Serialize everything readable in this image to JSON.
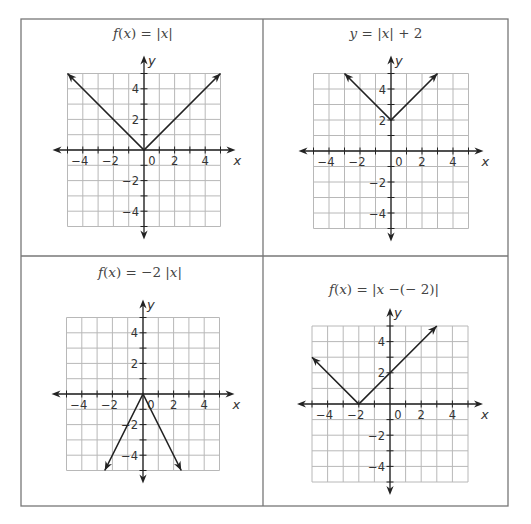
{
  "figure": {
    "frame": {
      "left": 21,
      "top": 19,
      "right": 508,
      "bottom": 506,
      "mid_x": 263,
      "mid_y": 256,
      "stroke": "#777777"
    },
    "colors": {
      "grid": "#b8b8b8",
      "axis": "#222222",
      "curve": "#222222",
      "text": "#444444"
    }
  },
  "chart_data": [
    {
      "type": "line",
      "title": "f(x) = |x|",
      "title_parts": [
        {
          "t": "f",
          "i": true
        },
        {
          "t": "(",
          "i": false
        },
        {
          "t": "x",
          "i": true
        },
        {
          "t": ") = |",
          "i": false
        },
        {
          "t": "x",
          "i": true
        },
        {
          "t": "|",
          "i": false
        }
      ],
      "xlabel": "x",
      "ylabel": "y",
      "xlim": [
        -5,
        5
      ],
      "ylim": [
        -5,
        5
      ],
      "grid": true,
      "x_tick_labels": [
        "-4",
        "-2",
        "0",
        "2",
        "4"
      ],
      "y_tick_labels": [
        "4",
        "2",
        "-2",
        "-4"
      ],
      "series": [
        {
          "name": "f(x) = |x|",
          "points": [
            [
              -5,
              5
            ],
            [
              0,
              0
            ],
            [
              5,
              5
            ]
          ],
          "arrows": "both"
        }
      ],
      "layout": {
        "ox": 144,
        "oy": 150,
        "unit": 15.3,
        "title_x": 143,
        "title_y": 38
      }
    },
    {
      "type": "line",
      "title": "y = |x| + 2",
      "title_parts": [
        {
          "t": "y",
          "i": true
        },
        {
          "t": " = |",
          "i": false
        },
        {
          "t": "x",
          "i": true
        },
        {
          "t": "| + 2",
          "i": false
        }
      ],
      "xlabel": "x",
      "ylabel": "y",
      "xlim": [
        -5,
        5
      ],
      "ylim": [
        -5,
        5
      ],
      "grid": true,
      "x_tick_labels": [
        "-4",
        "-2",
        "0",
        "2",
        "4"
      ],
      "y_tick_labels": [
        "4",
        "2",
        "-2",
        "-4"
      ],
      "series": [
        {
          "name": "y = |x| + 2",
          "points": [
            [
              -3,
              5
            ],
            [
              0,
              2
            ],
            [
              3,
              5
            ]
          ],
          "arrows": "both"
        }
      ],
      "layout": {
        "ox": 391,
        "oy": 151,
        "unit": 15.5,
        "title_x": 386,
        "title_y": 38
      }
    },
    {
      "type": "line",
      "title": "f(x) = -2|x|",
      "title_parts": [
        {
          "t": "f",
          "i": true
        },
        {
          "t": "(",
          "i": false
        },
        {
          "t": "x",
          "i": true
        },
        {
          "t": ") = −2 |",
          "i": false
        },
        {
          "t": "x",
          "i": true
        },
        {
          "t": "|",
          "i": false
        }
      ],
      "xlabel": "x",
      "ylabel": "y",
      "xlim": [
        -5,
        5
      ],
      "ylim": [
        -5,
        5
      ],
      "grid": true,
      "x_tick_labels": [
        "-4",
        "-2",
        "0",
        "2",
        "4"
      ],
      "y_tick_labels": [
        "4",
        "2",
        "-2",
        "-4"
      ],
      "series": [
        {
          "name": "f(x) = -2|x|",
          "points": [
            [
              -2.5,
              -5
            ],
            [
              0,
              0
            ],
            [
              2.5,
              -5
            ]
          ],
          "arrows": "both"
        }
      ],
      "layout": {
        "ox": 143,
        "oy": 394,
        "unit": 15.3,
        "title_x": 140,
        "title_y": 277
      }
    },
    {
      "type": "line",
      "title": "f(x) = |x - (- 2)|",
      "title_parts": [
        {
          "t": "f",
          "i": true
        },
        {
          "t": "(",
          "i": false
        },
        {
          "t": "x",
          "i": true
        },
        {
          "t": ") = |",
          "i": false
        },
        {
          "t": "x",
          "i": true
        },
        {
          "t": " −(− 2)|",
          "i": false
        }
      ],
      "xlabel": "x",
      "ylabel": "y",
      "xlim": [
        -5,
        5
      ],
      "ylim": [
        -5,
        5
      ],
      "grid": true,
      "x_tick_labels": [
        "-4",
        "-2",
        "0",
        "2",
        "4"
      ],
      "y_tick_labels": [
        "4",
        "2",
        "-2",
        "-4"
      ],
      "series": [
        {
          "name": "f(x) = |x + 2|",
          "points": [
            [
              -5,
              3
            ],
            [
              -2,
              0
            ],
            [
              3,
              5
            ]
          ],
          "arrows": "both"
        }
      ],
      "layout": {
        "ox": 390,
        "oy": 404,
        "unit": 15.6,
        "title_x": 384,
        "title_y": 294
      }
    }
  ]
}
